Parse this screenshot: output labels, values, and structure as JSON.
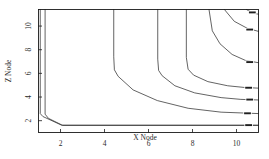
{
  "figure": {
    "background_color": "#ffffff",
    "foreground_color": "#1a1a1a"
  },
  "chart_data": {
    "type": "line",
    "plot_kind": "contour",
    "title": "",
    "subtitle": "",
    "xlabel": "X Node",
    "ylabel": "Z Node",
    "xlim": [
      1,
      11
    ],
    "ylim": [
      1,
      11.4
    ],
    "xticks": [
      2,
      4,
      6,
      8,
      10
    ],
    "xtick_labels": [
      "2",
      "4",
      "6",
      "8",
      "10"
    ],
    "yticks": [
      2,
      4,
      6,
      8,
      10
    ],
    "ytick_labels": [
      "2",
      "4",
      "6",
      "8",
      "10"
    ],
    "grid": false,
    "legend": false,
    "legend_position": "none",
    "frame": true,
    "tick_direction": "in",
    "line_color": "#303030",
    "contours": [
      {
        "name": "contour-1",
        "label": "",
        "points": [
          [
            1.08,
            11.4
          ],
          [
            1.08,
            2.6
          ],
          [
            1.2,
            2.35
          ],
          [
            2.05,
            1.62
          ],
          [
            11.0,
            1.62
          ]
        ]
      },
      {
        "name": "contour-2",
        "label": "",
        "points": [
          [
            1.3,
            11.4
          ],
          [
            1.3,
            2.55
          ],
          [
            1.45,
            2.2
          ],
          [
            2.1,
            1.6
          ],
          [
            11.0,
            1.6
          ]
        ]
      },
      {
        "name": "contour-3",
        "label": "",
        "points": [
          [
            4.42,
            11.4
          ],
          [
            4.42,
            7.4
          ],
          [
            4.45,
            6.3
          ],
          [
            4.62,
            5.75
          ],
          [
            5.3,
            4.6
          ],
          [
            6.4,
            3.7
          ],
          [
            7.8,
            3.05
          ],
          [
            9.3,
            2.72
          ],
          [
            11.0,
            2.6
          ]
        ]
      },
      {
        "name": "contour-4",
        "label": "",
        "points": [
          [
            6.42,
            11.4
          ],
          [
            6.42,
            7.2
          ],
          [
            6.46,
            6.25
          ],
          [
            6.62,
            5.8
          ],
          [
            7.2,
            4.95
          ],
          [
            8.1,
            4.35
          ],
          [
            9.3,
            3.95
          ],
          [
            10.2,
            3.8
          ],
          [
            11.0,
            3.75
          ]
        ]
      },
      {
        "name": "contour-5",
        "label": "",
        "points": [
          [
            7.72,
            11.4
          ],
          [
            7.72,
            7.35
          ],
          [
            7.8,
            6.35
          ],
          [
            8.05,
            5.85
          ],
          [
            8.7,
            5.3
          ],
          [
            9.6,
            4.95
          ],
          [
            10.4,
            4.8
          ],
          [
            11.0,
            4.75
          ]
        ]
      },
      {
        "name": "contour-6",
        "label": "",
        "points": [
          [
            8.75,
            11.4
          ],
          [
            8.9,
            9.6
          ],
          [
            9.25,
            8.5
          ],
          [
            9.8,
            7.6
          ],
          [
            10.4,
            7.1
          ],
          [
            11.0,
            6.9
          ]
        ]
      },
      {
        "name": "contour-7",
        "label": "",
        "points": [
          [
            9.45,
            11.4
          ],
          [
            9.9,
            10.4
          ],
          [
            10.5,
            9.8
          ],
          [
            11.0,
            9.55
          ]
        ]
      },
      {
        "name": "contour-8",
        "label": "",
        "points": [
          [
            10.45,
            11.4
          ],
          [
            10.75,
            11.1
          ],
          [
            11.0,
            11.0
          ]
        ]
      }
    ],
    "contour_labels": [
      {
        "name": "contour-label-1",
        "text": "",
        "x": 10.72,
        "y": 11.15
      },
      {
        "name": "contour-label-2",
        "text": "",
        "x": 10.6,
        "y": 9.7
      },
      {
        "name": "contour-label-3",
        "text": "",
        "x": 10.6,
        "y": 6.95
      },
      {
        "name": "contour-label-4",
        "text": "",
        "x": 10.55,
        "y": 4.78
      },
      {
        "name": "contour-label-5",
        "text": "",
        "x": 10.6,
        "y": 3.78
      },
      {
        "name": "contour-label-6",
        "text": "",
        "x": 10.5,
        "y": 2.62
      },
      {
        "name": "contour-label-7",
        "text": "",
        "x": 10.55,
        "y": 1.62
      }
    ]
  }
}
